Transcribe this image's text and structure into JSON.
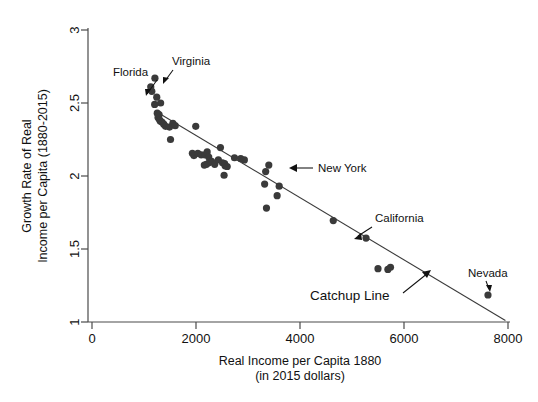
{
  "chart_data": {
    "type": "scatter",
    "title": "",
    "xlabel": "Real Income per Capita 1880",
    "xlabel_line2": "(in 2015 dollars)",
    "ylabel_line1": "Growth Rate of Real",
    "ylabel_line2": "Income per Capita (1880-2015)",
    "xlim": [
      0,
      8000
    ],
    "ylim": [
      1,
      3
    ],
    "xticks": [
      0,
      2000,
      4000,
      6000,
      8000
    ],
    "xtick_labels": [
      "0",
      "2000",
      "4000",
      "6000",
      "8000"
    ],
    "yticks": [
      1,
      1.5,
      2,
      2.5,
      3
    ],
    "ytick_labels": [
      "1",
      "1.5",
      "2",
      "2.5",
      "3"
    ],
    "grid": false,
    "legend": "none",
    "marker_color": "#3a3a3a",
    "line_color": "#3a3a3a",
    "points": [
      {
        "x": 1130,
        "y": 2.61
      },
      {
        "x": 1150,
        "y": 2.58
      },
      {
        "x": 1210,
        "y": 2.67
      },
      {
        "x": 1245,
        "y": 2.54
      },
      {
        "x": 1320,
        "y": 2.5
      },
      {
        "x": 1205,
        "y": 2.49
      },
      {
        "x": 1255,
        "y": 2.43
      },
      {
        "x": 1290,
        "y": 2.42
      },
      {
        "x": 1270,
        "y": 2.4
      },
      {
        "x": 1300,
        "y": 2.385
      },
      {
        "x": 1315,
        "y": 2.375
      },
      {
        "x": 1345,
        "y": 2.37
      },
      {
        "x": 1380,
        "y": 2.355
      },
      {
        "x": 1415,
        "y": 2.34
      },
      {
        "x": 1490,
        "y": 2.335
      },
      {
        "x": 1555,
        "y": 2.36
      },
      {
        "x": 1600,
        "y": 2.345
      },
      {
        "x": 1995,
        "y": 2.34
      },
      {
        "x": 1510,
        "y": 2.25
      },
      {
        "x": 1930,
        "y": 2.155
      },
      {
        "x": 1960,
        "y": 2.14
      },
      {
        "x": 2035,
        "y": 2.155
      },
      {
        "x": 2100,
        "y": 2.145
      },
      {
        "x": 2170,
        "y": 2.145
      },
      {
        "x": 2215,
        "y": 2.165
      },
      {
        "x": 2245,
        "y": 2.13
      },
      {
        "x": 2250,
        "y": 2.09
      },
      {
        "x": 2200,
        "y": 2.08
      },
      {
        "x": 2160,
        "y": 2.075
      },
      {
        "x": 2300,
        "y": 2.1
      },
      {
        "x": 2360,
        "y": 2.08
      },
      {
        "x": 2430,
        "y": 2.11
      },
      {
        "x": 2470,
        "y": 2.195
      },
      {
        "x": 2510,
        "y": 2.09
      },
      {
        "x": 2550,
        "y": 2.085
      },
      {
        "x": 2560,
        "y": 2.07
      },
      {
        "x": 2600,
        "y": 2.065
      },
      {
        "x": 2540,
        "y": 2.005
      },
      {
        "x": 2740,
        "y": 2.125
      },
      {
        "x": 2860,
        "y": 2.12
      },
      {
        "x": 2930,
        "y": 2.11
      },
      {
        "x": 3340,
        "y": 2.03
      },
      {
        "x": 3400,
        "y": 2.075
      },
      {
        "x": 3320,
        "y": 1.945
      },
      {
        "x": 3600,
        "y": 1.93
      },
      {
        "x": 3560,
        "y": 1.865
      },
      {
        "x": 3355,
        "y": 1.78
      },
      {
        "x": 4640,
        "y": 1.695
      },
      {
        "x": 5270,
        "y": 1.575
      },
      {
        "x": 5500,
        "y": 1.365
      },
      {
        "x": 5690,
        "y": 1.36
      },
      {
        "x": 5740,
        "y": 1.375
      },
      {
        "x": 7615,
        "y": 1.185
      }
    ],
    "fit_line": {
      "name": "Catchup Line",
      "x_start": 1215,
      "y_start": 2.445,
      "x_end": 7950,
      "y_end": 1.01
    },
    "annotations": [
      {
        "label": "Florida",
        "point_x": 1150,
        "point_y": 2.605
      },
      {
        "label": "Virginia",
        "point_x": 1210,
        "point_y": 2.67
      },
      {
        "label": "New York",
        "point_x": 3400,
        "point_y": 2.075
      },
      {
        "label": "California",
        "point_x": 5270,
        "point_y": 1.575
      },
      {
        "label": "Nevada",
        "point_x": 7615,
        "point_y": 1.185
      },
      {
        "label": "Catchup Line",
        "point_x": 6150,
        "point_y": 1.33
      }
    ]
  }
}
